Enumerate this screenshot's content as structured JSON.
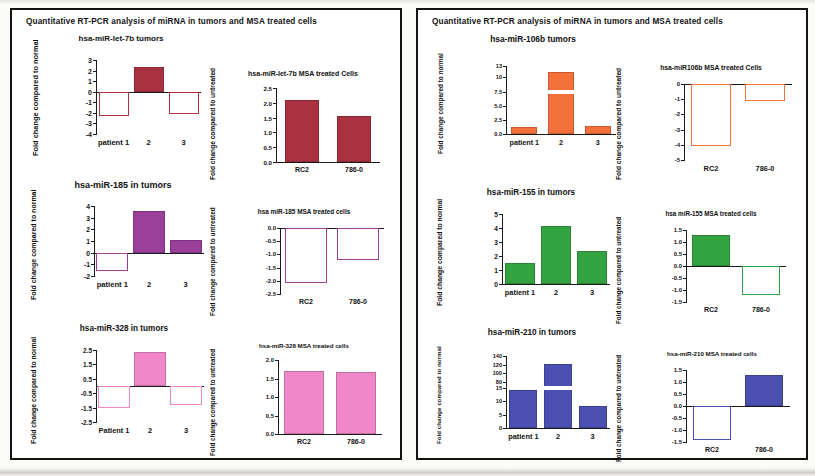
{
  "figure": {
    "panels": [
      {
        "id": "panel-left",
        "title": "Quantitative  RT-PCR analysis of miRNA in tumors and MSA treated cells",
        "charts": [
          "let7b_tumors",
          "let7b_msa",
          "mir185_tumors",
          "mir185_msa",
          "mir328_tumors",
          "mir328_msa"
        ]
      },
      {
        "id": "panel-right",
        "title": "Quantitative  RT-PCR analysis of miRNA in tumors and MSA treated cells",
        "charts": [
          "mir106b_tumors",
          "mir106b_msa",
          "mir155_tumors",
          "mir155_msa",
          "mir210_tumors",
          "mir210_msa"
        ]
      }
    ]
  },
  "chart_data": [
    {
      "id": "let7b_tumors",
      "type": "bar",
      "title": "hsa-miR-let-7b tumors",
      "ylabel": "Fold change compared\nto normal",
      "xlabel": "",
      "categories": [
        "patient 1",
        "2",
        "3"
      ],
      "values": [
        -2.3,
        2.3,
        -2.1
      ],
      "yticks": [
        3,
        2,
        1,
        0,
        -1,
        -2,
        -3,
        -4
      ],
      "ylim": [
        -4,
        3
      ],
      "color": "#a8323f",
      "fill_rule": "positive-filled-negative-hollow",
      "grid": false,
      "legend": "none"
    },
    {
      "id": "let7b_msa",
      "type": "bar",
      "title": "hsa-miR-let-7b  MSA treated Cells",
      "ylabel": "Fold change compared\nto untreated",
      "xlabel": "",
      "categories": [
        "RC2",
        "786-0"
      ],
      "values": [
        2.1,
        1.55
      ],
      "yticks": [
        "2.5",
        "2.0",
        "1.5",
        "1.0",
        "0.5",
        "0.0"
      ],
      "ylim": [
        0,
        2.5
      ],
      "color": "#a8323f",
      "fill_rule": "all-filled",
      "grid": false,
      "legend": "none"
    },
    {
      "id": "mir185_tumors",
      "type": "bar",
      "title": "hsa-miR-185  in tumors",
      "ylabel": "Fold change compared\nto normal",
      "xlabel": "",
      "categories": [
        "patient 1",
        "2",
        "3"
      ],
      "values": [
        -1.6,
        3.6,
        1.1
      ],
      "yticks": [
        4,
        3,
        2,
        1,
        0,
        -1,
        -2
      ],
      "ylim": [
        -2,
        4
      ],
      "color": "#9a3f9a",
      "fill_rule": "positive-filled-negative-hollow",
      "grid": false,
      "legend": "none"
    },
    {
      "id": "mir185_msa",
      "type": "bar",
      "title": "hsa miR-185 MSA treated cells",
      "ylabel": "Fold change compared\nto untreated",
      "xlabel": "",
      "categories": [
        "RC2",
        "786-0"
      ],
      "values": [
        -2.1,
        -1.2
      ],
      "yticks": [
        "0.0",
        "-0.5",
        "-1.0",
        "-1.5",
        "-2.0",
        "-2.5"
      ],
      "ylim": [
        -2.5,
        0
      ],
      "color": "#9a3f9a",
      "fill_rule": "all-hollow",
      "grid": false,
      "legend": "none"
    },
    {
      "id": "mir328_tumors",
      "type": "bar",
      "title": "hsa-miR-328 in tumors",
      "ylabel": "Fold change compared\nto normal",
      "xlabel": "",
      "categories": [
        "Patient  1",
        "2",
        "3"
      ],
      "values": [
        -1.55,
        2.35,
        -1.3
      ],
      "yticks": [
        "2.5",
        "1.5",
        "0.5",
        "-0.5",
        "-1.5",
        "-2.5"
      ],
      "ylim": [
        -2.5,
        2.5
      ],
      "color": "#ef87c8",
      "fill_rule": "positive-filled-negative-hollow",
      "grid": false,
      "legend": "none"
    },
    {
      "id": "mir328_msa",
      "type": "bar",
      "title": "hsa-miR-328 MSA treated cells",
      "ylabel": "Fold change compared\nto untreated",
      "xlabel": "",
      "categories": [
        "RC2",
        "786-0"
      ],
      "values": [
        1.7,
        1.68
      ],
      "yticks": [
        "2.0",
        "1.5",
        "1.0",
        "0.5",
        "0.0"
      ],
      "ylim": [
        0,
        2.0
      ],
      "color": "#ef87c8",
      "fill_rule": "all-filled",
      "grid": false,
      "legend": "none"
    },
    {
      "id": "mir106b_tumors",
      "type": "bar",
      "title": "hsa-miR-106b tumors",
      "ylabel": "Fold change\ncompared to normal",
      "xlabel": "",
      "categories": [
        "patient  1",
        "2",
        "3"
      ],
      "values": [
        1.2,
        11.5,
        1.4
      ],
      "yticks": [
        "13",
        "10",
        "7.5",
        "5.0",
        "2.5",
        "0.0"
      ],
      "ylim": [
        0,
        13
      ],
      "axis_note": "broken axis between 7.5 and 10",
      "color": "#f4703a",
      "fill_rule": "all-filled",
      "grid": false,
      "legend": "none"
    },
    {
      "id": "mir106b_msa",
      "type": "bar",
      "title": "hsa-miR106b  MSA treated Cells",
      "ylabel": "Fold change compared\nto untreated",
      "xlabel": "",
      "categories": [
        "RC2",
        "786-0"
      ],
      "values": [
        -4.1,
        -1.1
      ],
      "yticks": [
        "0",
        "-1",
        "-2",
        "-3",
        "-4",
        "-5"
      ],
      "ylim": [
        -5,
        0
      ],
      "color": "#f4703a",
      "fill_rule": "all-hollow",
      "grid": false,
      "legend": "none"
    },
    {
      "id": "mir155_tumors",
      "type": "bar",
      "title": "hsa-miR-155  in tumors",
      "ylabel": "Fold change compared\nto normal",
      "xlabel": "",
      "categories": [
        "patient 1",
        "2",
        "3"
      ],
      "values": [
        1.5,
        4.15,
        2.35
      ],
      "yticks": [
        5,
        4,
        3,
        2,
        1,
        0
      ],
      "ylim": [
        0,
        5
      ],
      "color": "#33a341",
      "fill_rule": "all-filled",
      "grid": false,
      "legend": "none"
    },
    {
      "id": "mir155_msa",
      "type": "bar",
      "title": "hsa miR-155 MSA treated cells",
      "ylabel": "Fold change compared\nto untreated",
      "xlabel": "",
      "categories": [
        "RC2",
        "786-0"
      ],
      "values": [
        1.3,
        -1.2
      ],
      "yticks": [
        "1.5",
        "1.0",
        "0.5",
        "0.0",
        "-0.5",
        "-1.0",
        "-1.5"
      ],
      "ylim": [
        -1.5,
        1.5
      ],
      "color": "#33a341",
      "fill_rule": "positive-filled-negative-hollow",
      "grid": false,
      "legend": "none"
    },
    {
      "id": "mir210_tumors",
      "type": "bar",
      "title": "hsa-miR-210 in tumors",
      "ylabel": "Fold change compared\nto normal",
      "xlabel": "",
      "categories": [
        "patient  1",
        "2",
        "3"
      ],
      "values": [
        14,
        122,
        8
      ],
      "yticks": [
        "140",
        "120",
        "100",
        "80",
        "15",
        "10",
        "5",
        "0"
      ],
      "ylim": [
        0,
        140
      ],
      "axis_note": "broken axis between 15 and 80",
      "color": "#4a4fb0",
      "fill_rule": "all-filled",
      "grid": false,
      "legend": "none"
    },
    {
      "id": "mir210_msa",
      "type": "bar",
      "title": "hsa-miR-210 MSA treated cells",
      "ylabel": "Fold change compared\nto untreated",
      "xlabel": "",
      "categories": [
        "RC2",
        "786-0"
      ],
      "values": [
        -1.4,
        1.3
      ],
      "yticks": [
        "1.5",
        "1.0",
        "0.5",
        "0.0",
        "-0.5",
        "-1.0",
        "-1.5"
      ],
      "ylim": [
        -1.5,
        1.5
      ],
      "color": "#4a4fb0",
      "fill_rule": "positive-filled-negative-hollow",
      "grid": false,
      "legend": "none"
    }
  ]
}
